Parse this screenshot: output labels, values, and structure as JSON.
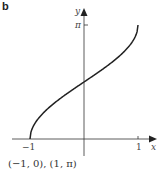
{
  "panel_label": "b",
  "caption": "(−1, 0), (1, π)",
  "chart_data": {
    "type": "line",
    "title": "",
    "xlabel": "x",
    "ylabel": "y",
    "x_ticks": [
      {
        "value": -1,
        "label": "−1"
      },
      {
        "value": 1,
        "label": "1"
      }
    ],
    "y_ticks": [
      {
        "value": 3.14159,
        "label": "π"
      }
    ],
    "xlim": [
      -1.5,
      1.2
    ],
    "ylim": [
      0,
      3.5
    ],
    "grid": false,
    "series": [
      {
        "name": "y = arcsin(x) + π/2",
        "x": [
          -1,
          -0.9,
          -0.7,
          -0.5,
          -0.25,
          0,
          0.25,
          0.5,
          0.7,
          0.9,
          1
        ],
        "y": [
          0,
          0.451,
          0.795,
          1.047,
          1.318,
          1.571,
          1.823,
          2.094,
          2.346,
          2.691,
          3.142
        ]
      }
    ],
    "annotations": [
      "(−1, 0)",
      "(1, π)"
    ]
  }
}
